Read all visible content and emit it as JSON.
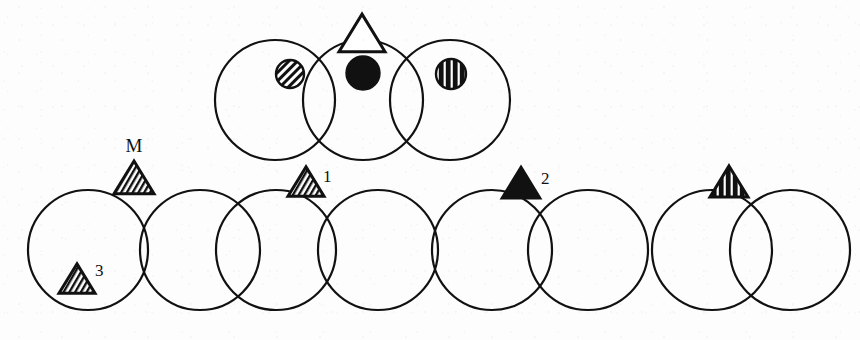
{
  "figure": {
    "background_color": "#fdfdfd",
    "stroke_color": "#111111",
    "fill_color": "#111111",
    "width": 860,
    "height": 340,
    "stroke_width": 2.2,
    "circle_radius": 60
  },
  "labels": {
    "m": "M",
    "one": "1",
    "two": "2",
    "three": "3"
  },
  "top_row": {
    "name": "top-circle-group",
    "circle_radius": 60,
    "center_y": 100,
    "circles": [
      {
        "id": "top-circle-1",
        "cx": 275,
        "cy": 100,
        "r": 60
      },
      {
        "id": "top-circle-2",
        "cx": 363,
        "cy": 100,
        "r": 60
      },
      {
        "id": "top-circle-3",
        "cx": 450,
        "cy": 100,
        "r": 60
      }
    ],
    "markers": [
      {
        "id": "marker-hatched-circle",
        "shape": "circle",
        "fill_style": "diagonal-stripe",
        "cx": 290,
        "cy": 74,
        "r": 14,
        "label": ""
      },
      {
        "id": "marker-solid-circle",
        "shape": "circle",
        "fill_style": "solid",
        "cx": 363,
        "cy": 73,
        "r": 17,
        "label": ""
      },
      {
        "id": "marker-striped-circle",
        "shape": "circle",
        "fill_style": "vertical-stripe",
        "cx": 451,
        "cy": 74,
        "r": 15,
        "label": ""
      },
      {
        "id": "marker-open-triangle",
        "shape": "triangle",
        "fill_style": "open",
        "cx": 362,
        "cy": 36,
        "size": 23,
        "label": ""
      }
    ]
  },
  "bottom_row": {
    "name": "bottom-circle-group",
    "circle_radius": 60,
    "center_y": 250,
    "circles": [
      {
        "id": "bottom-circle-1",
        "cx": 88,
        "cy": 250,
        "r": 60
      },
      {
        "id": "bottom-circle-2",
        "cx": 200,
        "cy": 250,
        "r": 60
      },
      {
        "id": "bottom-circle-3",
        "cx": 276,
        "cy": 250,
        "r": 60
      },
      {
        "id": "bottom-circle-4",
        "cx": 378,
        "cy": 250,
        "r": 60
      },
      {
        "id": "bottom-circle-5",
        "cx": 492,
        "cy": 250,
        "r": 60
      },
      {
        "id": "bottom-circle-6",
        "cx": 588,
        "cy": 250,
        "r": 60
      },
      {
        "id": "bottom-circle-7",
        "cx": 712,
        "cy": 250,
        "r": 60
      },
      {
        "id": "bottom-circle-8",
        "cx": 790,
        "cy": 250,
        "r": 60
      }
    ],
    "markers": [
      {
        "id": "marker-triangle-m",
        "shape": "triangle",
        "fill_style": "hatched",
        "cx": 134,
        "cy": 180,
        "size": 20,
        "label_key": "m",
        "label_x": 134,
        "label_y": 152
      },
      {
        "id": "marker-triangle-3",
        "shape": "triangle",
        "fill_style": "hatched",
        "cx": 77,
        "cy": 281,
        "size": 18,
        "label_key": "three",
        "label_x": 95,
        "label_y": 276
      },
      {
        "id": "marker-triangle-1",
        "shape": "triangle",
        "fill_style": "hatched",
        "cx": 306,
        "cy": 184,
        "size": 18,
        "label_key": "one",
        "label_x": 323,
        "label_y": 182
      },
      {
        "id": "marker-triangle-2",
        "shape": "triangle",
        "fill_style": "solid",
        "cx": 521,
        "cy": 185,
        "size": 20,
        "label_key": "two",
        "label_x": 541,
        "label_y": 184
      },
      {
        "id": "marker-triangle-striped",
        "shape": "triangle",
        "fill_style": "vertical-stripe",
        "cx": 729,
        "cy": 184,
        "size": 19,
        "label_key": "",
        "label_x": 0,
        "label_y": 0
      }
    ]
  }
}
